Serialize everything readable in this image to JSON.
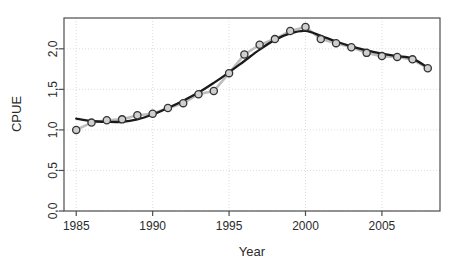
{
  "figure": {
    "background": "#ffffff",
    "frame_color": "#4d4d4d",
    "grid_color": "#d9d9d9",
    "point_fill": "#cfcfcf",
    "point_stroke": "#333333",
    "observed_line_color": "#bdbdbd",
    "fit_line_color": "#1a1a1a"
  },
  "chart_data": {
    "type": "line",
    "title": "",
    "subtitle": "",
    "xlabel": "Year",
    "ylabel": "CPUE",
    "xlim": [
      1984.2,
      2008.8
    ],
    "ylim": [
      0.0,
      2.38
    ],
    "grid": true,
    "legend": "none",
    "xticks": [
      1985,
      1990,
      1995,
      2000,
      2005
    ],
    "xtick_labels": [
      "1985",
      "1990",
      "1995",
      "2000",
      "2005"
    ],
    "yticks": [
      0.0,
      0.5,
      1.0,
      1.5,
      2.0
    ],
    "ytick_labels": [
      "0,0",
      "0,5",
      "1,0",
      "1,5",
      "2,0"
    ],
    "x": [
      1985,
      1986,
      1987,
      1988,
      1989,
      1990,
      1991,
      1992,
      1993,
      1994,
      1995,
      1996,
      1997,
      1998,
      1999,
      2000,
      2001,
      2002,
      2003,
      2004,
      2005,
      2006,
      2007,
      2008
    ],
    "series": [
      {
        "name": "Observed CPUE",
        "marker": "circle",
        "values": [
          1.0,
          1.09,
          1.12,
          1.13,
          1.18,
          1.2,
          1.27,
          1.33,
          1.44,
          1.48,
          1.7,
          1.93,
          2.05,
          2.12,
          2.22,
          2.27,
          2.12,
          2.07,
          2.02,
          1.95,
          1.91,
          1.9,
          1.87,
          1.76
        ]
      },
      {
        "name": "Smoothed fit",
        "marker": "none",
        "values": [
          1.14,
          1.11,
          1.1,
          1.1,
          1.13,
          1.19,
          1.27,
          1.36,
          1.46,
          1.58,
          1.71,
          1.85,
          1.99,
          2.11,
          2.19,
          2.22,
          2.16,
          2.09,
          2.03,
          1.98,
          1.94,
          1.91,
          1.88,
          1.77
        ]
      }
    ],
    "annotations": []
  }
}
